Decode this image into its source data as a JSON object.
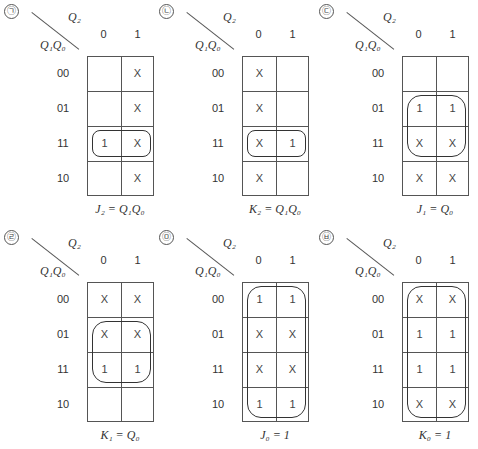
{
  "figure": {
    "row_header": "Q₁Q₀",
    "col_header": "Q₂",
    "col_labels": [
      "0",
      "1"
    ],
    "row_labels": [
      "00",
      "01",
      "11",
      "10"
    ]
  },
  "maps": [
    {
      "marker": "㉠",
      "cells": [
        [
          "",
          "X"
        ],
        [
          "",
          "X"
        ],
        [
          "1",
          "X"
        ],
        [
          "",
          "X"
        ]
      ],
      "equation": "J₂ = Q₁Q₀",
      "loop": {
        "row": 2,
        "col": 0,
        "rows": 1,
        "cols": 2
      }
    },
    {
      "marker": "㉡",
      "cells": [
        [
          "X",
          ""
        ],
        [
          "X",
          ""
        ],
        [
          "X",
          "1"
        ],
        [
          "X",
          ""
        ]
      ],
      "equation": "K₂ = Q₁Q₀",
      "loop": {
        "row": 2,
        "col": 0,
        "rows": 1,
        "cols": 2
      }
    },
    {
      "marker": "㉢",
      "cells": [
        [
          "",
          ""
        ],
        [
          "1",
          "1"
        ],
        [
          "X",
          "X"
        ],
        [
          "X",
          "X"
        ]
      ],
      "equation": "J₁ = Q₀",
      "loop": {
        "row": 1,
        "col": 0,
        "rows": 2,
        "cols": 2
      }
    },
    {
      "marker": "㉣",
      "cells": [
        [
          "X",
          "X"
        ],
        [
          "X",
          "X"
        ],
        [
          "1",
          "1"
        ],
        [
          "",
          ""
        ]
      ],
      "equation": "K₁ = Q₀",
      "loop": {
        "row": 1,
        "col": 0,
        "rows": 2,
        "cols": 2
      }
    },
    {
      "marker": "㉤",
      "cells": [
        [
          "1",
          "1"
        ],
        [
          "X",
          "X"
        ],
        [
          "X",
          "X"
        ],
        [
          "1",
          "1"
        ]
      ],
      "equation": "J₀ = 1",
      "loop": {
        "row": 0,
        "col": 0,
        "rows": 4,
        "cols": 2
      }
    },
    {
      "marker": "㉥",
      "cells": [
        [
          "X",
          "X"
        ],
        [
          "1",
          "1"
        ],
        [
          "1",
          "1"
        ],
        [
          "X",
          "X"
        ]
      ],
      "equation": "K₀ = 1",
      "loop": {
        "row": 0,
        "col": 0,
        "rows": 4,
        "cols": 2
      }
    }
  ]
}
